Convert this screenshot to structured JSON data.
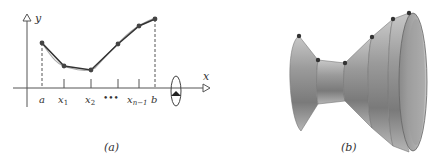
{
  "panel_a": {
    "caption": "(a)",
    "axis_x_label": "x",
    "axis_y_label": "y",
    "tick_labels": [
      "a",
      "x1",
      "x2",
      "•••",
      "xn-1",
      "b"
    ],
    "polyline_points": [
      [
        42,
        43
      ],
      [
        64,
        66
      ],
      [
        91,
        70
      ],
      [
        118,
        44
      ],
      [
        139,
        26
      ],
      [
        155,
        19
      ]
    ],
    "rotation_icon": "rotate-about-x-axis-icon"
  },
  "panel_b": {
    "caption": "(b)",
    "description": "surface of revolution formed by rotating the polygonal path about the x-axis (frustums of cones)"
  }
}
